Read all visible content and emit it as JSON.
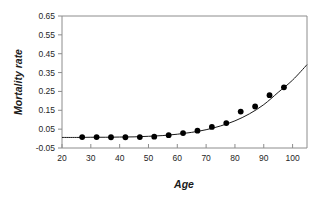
{
  "chart_data": {
    "type": "scatter",
    "title": "",
    "xlabel": "Age",
    "ylabel": "Mortality rate",
    "xlim": [
      20,
      105
    ],
    "ylim": [
      -0.05,
      0.65
    ],
    "xticks": [
      20,
      30,
      40,
      50,
      60,
      70,
      80,
      90,
      100
    ],
    "yticks": [
      -0.05,
      0.05,
      0.15,
      0.25,
      0.35,
      0.45,
      0.55,
      0.65
    ],
    "xtick_labels": [
      "20",
      "30",
      "40",
      "50",
      "60",
      "70",
      "80",
      "90",
      "100"
    ],
    "ytick_labels": [
      "-0.05",
      "0.05",
      "0.15",
      "0.25",
      "0.35",
      "0.45",
      "0.55",
      "0.65"
    ],
    "grid": false,
    "legend": null,
    "marker_color": "#000000",
    "curve_color": "#1a1a1a",
    "axis_color": "#8c8c8c",
    "series": [
      {
        "name": "Observed mortality rate",
        "kind": "scatter",
        "x": [
          27,
          32,
          37,
          42,
          47,
          52,
          57,
          62,
          67,
          72,
          77,
          82,
          87,
          92,
          97
        ],
        "y": [
          0.008,
          0.008,
          0.007,
          0.007,
          0.008,
          0.01,
          0.018,
          0.029,
          0.042,
          0.062,
          0.082,
          0.143,
          0.17,
          0.23,
          0.272
        ]
      },
      {
        "name": "Fitted exponential curve",
        "kind": "line",
        "x": [
          20,
          25,
          30,
          35,
          40,
          45,
          50,
          55,
          60,
          65,
          70,
          75,
          80,
          85,
          90,
          95,
          100,
          105
        ],
        "y": [
          0.006,
          0.006,
          0.007,
          0.007,
          0.008,
          0.009,
          0.012,
          0.016,
          0.023,
          0.033,
          0.047,
          0.067,
          0.094,
          0.131,
          0.18,
          0.245,
          0.31,
          0.392
        ]
      }
    ]
  }
}
